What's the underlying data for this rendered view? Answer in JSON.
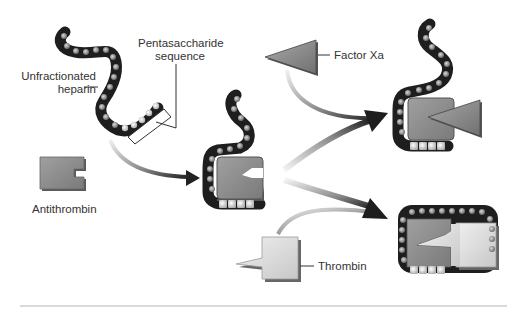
{
  "labels": {
    "unfractionated_heparin_line1": "Unfractionated",
    "unfractionated_heparin_line2": "heparin",
    "pentasaccharide_line1": "Pentasaccharide",
    "pentasaccharide_line2": "sequence",
    "antithrombin": "Antithrombin",
    "factor_xa": "Factor Xa",
    "thrombin": "Thrombin"
  },
  "colors": {
    "chain_dark": "#1e1e1e",
    "bead": "#8a8a8a",
    "bead_light": "#d0d0d0",
    "antithrombin": "#8c8c8c",
    "factor_xa": "#8a8a8a",
    "thrombin": "#dcdcdc",
    "arrow_dark": "#222222",
    "label": "#333333",
    "divider": "#cccccc"
  },
  "nodes": [
    {
      "id": "unfractionated-heparin",
      "label": "Unfractionated heparin"
    },
    {
      "id": "pentasaccharide-sequence",
      "label": "Pentasaccharide sequence"
    },
    {
      "id": "antithrombin",
      "label": "Antithrombin"
    },
    {
      "id": "heparin-antithrombin-complex",
      "label": ""
    },
    {
      "id": "factor-xa",
      "label": "Factor Xa"
    },
    {
      "id": "thrombin",
      "label": "Thrombin"
    },
    {
      "id": "heparin-antithrombin-factor-xa-complex",
      "label": ""
    },
    {
      "id": "heparin-antithrombin-thrombin-complex",
      "label": ""
    }
  ],
  "edges": [
    {
      "from": "unfractionated-heparin",
      "to": "heparin-antithrombin-complex"
    },
    {
      "from": "antithrombin",
      "to": "heparin-antithrombin-complex"
    },
    {
      "from": "heparin-antithrombin-complex",
      "to": "heparin-antithrombin-factor-xa-complex"
    },
    {
      "from": "factor-xa",
      "to": "heparin-antithrombin-factor-xa-complex"
    },
    {
      "from": "heparin-antithrombin-complex",
      "to": "heparin-antithrombin-thrombin-complex"
    },
    {
      "from": "thrombin",
      "to": "heparin-antithrombin-thrombin-complex"
    }
  ]
}
